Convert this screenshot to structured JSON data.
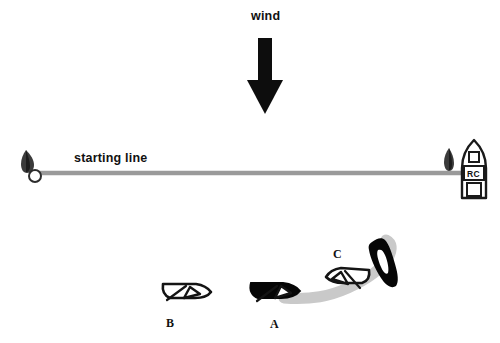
{
  "diagram": {
    "type": "sailing-race-start-diagram",
    "background_color": "#ffffff",
    "ink_color": "#111111",
    "line_color": "#9a9a9a",
    "wake_color": "#c9c9c9"
  },
  "wind": {
    "label": "wind",
    "arrow_direction": "down",
    "arrow_color": "#0d0d0d"
  },
  "start_line": {
    "label": "starting line",
    "color": "#9a9a9a",
    "pin_end": {
      "name": "pin-buoy",
      "shape": "flag-buoy"
    },
    "committee_boat": {
      "name": "race-committee-boat",
      "label": "RC",
      "flag": "committee-flag"
    }
  },
  "boats": [
    {
      "id": "B",
      "label": "B",
      "fill": "outline",
      "heading": "right"
    },
    {
      "id": "A",
      "label": "A",
      "fill": "solid",
      "heading": "right"
    },
    {
      "id": "C",
      "label": "C",
      "fill": "outline",
      "heading": "left"
    },
    {
      "id": "A2",
      "label": "",
      "fill": "solid",
      "heading": "up-left"
    }
  ],
  "track": {
    "name": "boat-a-wake-track",
    "color": "#c9c9c9",
    "description": "curved wake from boat A sweeping right and looping up to the black boat"
  }
}
